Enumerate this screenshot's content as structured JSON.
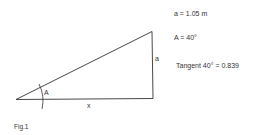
{
  "figure": {
    "caption": "Fig.1",
    "labels": {
      "opposite_side": "a",
      "angle": "A",
      "adjacent_side": "x"
    },
    "given": [
      "a = 1.05 m",
      "A = 40°",
      "Tangent 40° = 0.839"
    ],
    "colors": {
      "line": "#333333",
      "background": "#ffffff"
    }
  }
}
